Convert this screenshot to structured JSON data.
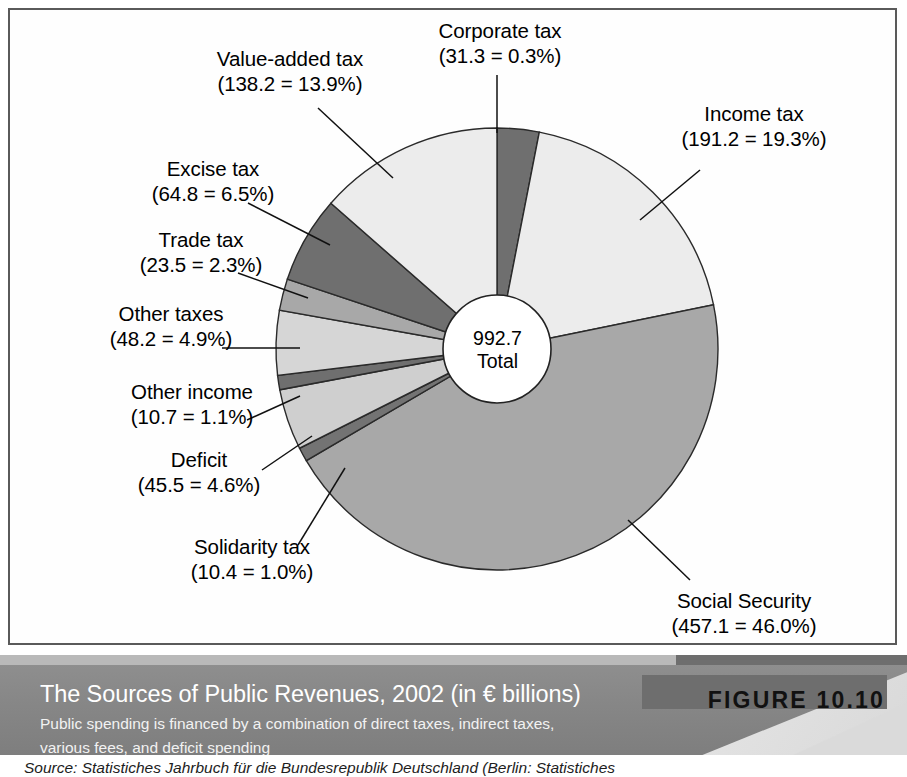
{
  "figure": {
    "badge_label": "FIGURE 10.10",
    "title": "The Sources of Public Revenues, 2002 (in € billions)",
    "subtitle_line1": "Public spending is financed by a combination of direct taxes, indirect taxes,",
    "subtitle_line2": "various fees, and deficit spending",
    "source": "Source: Statistiches Jahrbuch für die Bundesrepublik Deutschland (Berlin: Statistiches"
  },
  "center": {
    "value": "992.7",
    "caption": "Total"
  },
  "labels": {
    "corporate_tax": {
      "name": "Corporate tax",
      "detail": "(31.3 = 0.3%)"
    },
    "value_added_tax": {
      "name": "Value-added tax",
      "detail": "(138.2 = 13.9%)"
    },
    "excise_tax": {
      "name": "Excise tax",
      "detail": "(64.8 = 6.5%)"
    },
    "trade_tax": {
      "name": "Trade tax",
      "detail": "(23.5 = 2.3%)"
    },
    "other_taxes": {
      "name": "Other taxes",
      "detail": "(48.2 = 4.9%)"
    },
    "other_income": {
      "name": "Other income",
      "detail": "(10.7 = 1.1%)"
    },
    "deficit": {
      "name": "Deficit",
      "detail": "(45.5 = 4.6%)"
    },
    "solidarity_tax": {
      "name": "Solidarity tax",
      "detail": "(10.4 = 1.0%)"
    },
    "income_tax": {
      "name": "Income tax",
      "detail": "(191.2 = 19.3%)"
    },
    "social_security": {
      "name": "Social Security",
      "detail": "(457.1 = 46.0%)"
    }
  },
  "chart_data": {
    "type": "pie",
    "title": "The Sources of Public Revenues, 2002 (in € billions)",
    "subtitle": "Public spending is financed by a combination of direct taxes, indirect taxes, various fees, and deficit spending",
    "total": 992.7,
    "total_label": "992.7 Total",
    "units": "€ billions",
    "donut": true,
    "inner_radius_ratio": 0.245,
    "start_angle_deg": 0,
    "direction": "clockwise",
    "legend": "none (direct labels with leader lines)",
    "categories": [
      "Corporate tax",
      "Income tax",
      "Social Security",
      "Solidarity tax",
      "Deficit",
      "Other income",
      "Other taxes",
      "Trade tax",
      "Excise tax",
      "Value-added tax"
    ],
    "values": [
      31.3,
      191.2,
      457.1,
      10.4,
      45.5,
      10.7,
      48.2,
      23.5,
      64.8,
      138.2
    ],
    "percents": [
      0.3,
      19.3,
      46.0,
      1.0,
      4.6,
      1.1,
      4.9,
      2.3,
      6.5,
      13.9
    ],
    "colors": [
      "#6f6f6f",
      "#ececec",
      "#a8a8a8",
      "#737373",
      "#cfcfcf",
      "#6f6f6f",
      "#d6d6d6",
      "#a8a8a8",
      "#6f6f6f",
      "#ececec"
    ],
    "slices": [
      {
        "label": "Corporate tax",
        "value": 31.3,
        "percent": 0.3,
        "percent_of_total": 3.15,
        "color": "#6f6f6f",
        "tone": "dark"
      },
      {
        "label": "Income tax",
        "value": 191.2,
        "percent": 19.3,
        "percent_of_total": 19.26,
        "color": "#ececec",
        "tone": "very-light"
      },
      {
        "label": "Social Security",
        "value": 457.1,
        "percent": 46.0,
        "percent_of_total": 46.05,
        "color": "#a8a8a8",
        "tone": "medium"
      },
      {
        "label": "Solidarity tax",
        "value": 10.4,
        "percent": 1.0,
        "percent_of_total": 1.05,
        "color": "#737373",
        "tone": "dark"
      },
      {
        "label": "Deficit",
        "value": 45.5,
        "percent": 4.6,
        "percent_of_total": 4.58,
        "color": "#cfcfcf",
        "tone": "light"
      },
      {
        "label": "Other income",
        "value": 10.7,
        "percent": 1.1,
        "percent_of_total": 1.08,
        "color": "#6f6f6f",
        "tone": "dark"
      },
      {
        "label": "Other taxes",
        "value": 48.2,
        "percent": 4.9,
        "percent_of_total": 4.86,
        "color": "#d6d6d6",
        "tone": "light"
      },
      {
        "label": "Trade tax",
        "value": 23.5,
        "percent": 2.3,
        "percent_of_total": 2.37,
        "color": "#a8a8a8",
        "tone": "medium"
      },
      {
        "label": "Excise tax",
        "value": 64.8,
        "percent": 6.5,
        "percent_of_total": 6.53,
        "color": "#6f6f6f",
        "tone": "dark"
      },
      {
        "label": "Value-added tax",
        "value": 138.2,
        "percent": 13.9,
        "percent_of_total": 13.92,
        "color": "#ececec",
        "tone": "very-light"
      }
    ]
  }
}
